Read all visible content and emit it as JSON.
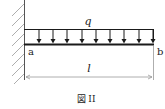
{
  "diagram": {
    "type": "cantilever-beam-uniform-load",
    "load_label": "q",
    "left_end_label": "a",
    "right_end_label": "b",
    "length_label": "l",
    "caption": "図 II",
    "arrow_count": 9,
    "colors": {
      "line": "#1a1a1a",
      "hatch": "#888888",
      "dimension": "#999999"
    }
  }
}
